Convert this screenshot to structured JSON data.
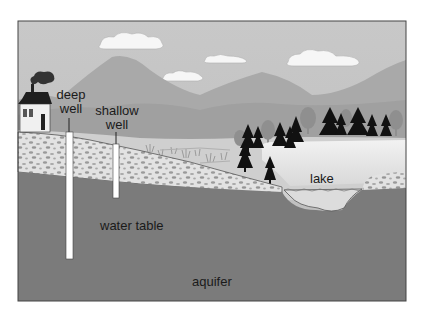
{
  "diagram": {
    "type": "groundwater-cross-section",
    "labels": {
      "deep_well_line1": "deep",
      "deep_well_line2": "well",
      "shallow_well_line1": "shallow",
      "shallow_well_line2": "well",
      "lake": "lake",
      "water_table": "water table",
      "aquifer": "aquifer"
    },
    "elements": [
      "house",
      "chimney-smoke",
      "clouds",
      "mountains",
      "trees",
      "marsh-grass",
      "gravel-soil-layer",
      "deep-well-pipe",
      "shallow-well-pipe",
      "lake",
      "aquifer-layer"
    ]
  },
  "colors": {
    "sky": "#c4c4c4",
    "mountain_far": "#a8a8a8",
    "mountain_near": "#9c9c9c",
    "ground_surface": "#d2d2d2",
    "gravel": "#e0e0e0",
    "aquifer": "#7a7a7a",
    "lake": "#ececec",
    "tree_dark": "#111111",
    "tree_light": "#8e8e8e",
    "well_pipe": "#ffffff",
    "frame": "#444444"
  }
}
